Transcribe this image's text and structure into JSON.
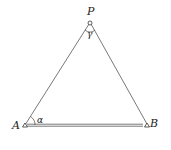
{
  "diagram": {
    "type": "triangle-survey",
    "points": {
      "P": {
        "label": "P",
        "x": 90,
        "y": 22
      },
      "A": {
        "label": "A",
        "x": 25,
        "y": 125
      },
      "B": {
        "label": "B",
        "x": 147,
        "y": 125
      }
    },
    "angles": {
      "alpha": {
        "label": "α",
        "vertex": "A"
      },
      "gamma": {
        "label": "γ",
        "vertex": "P"
      }
    },
    "colors": {
      "line": "#444444",
      "text": "#222222"
    }
  }
}
